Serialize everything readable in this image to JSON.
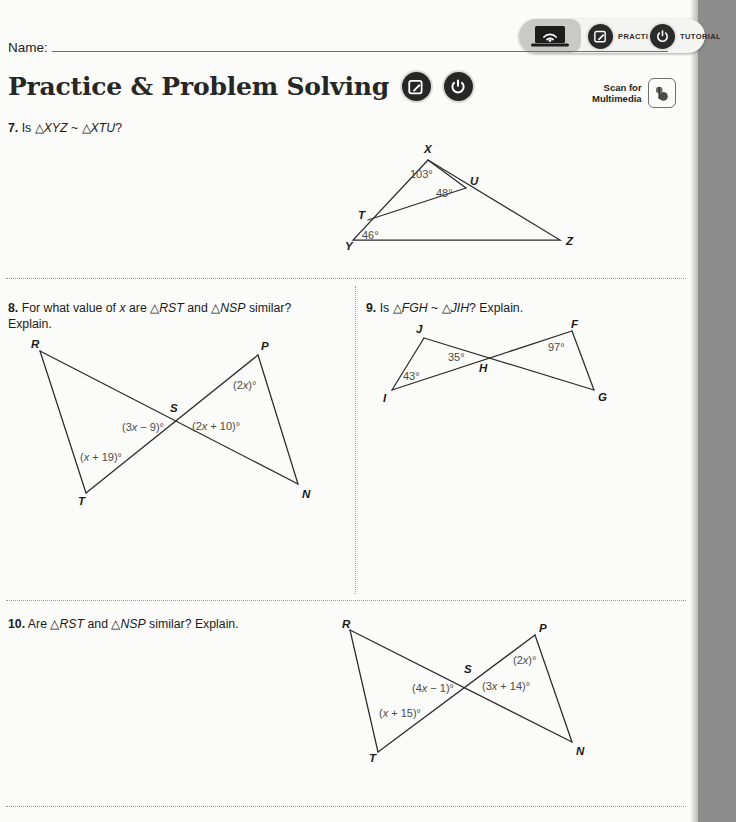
{
  "page": {
    "background_color": "#fbfbf9",
    "margin_strip_color": "#8d8d8d",
    "ink_color": "#1b1b1b",
    "angle_label_color": "#4b4b4b"
  },
  "toolbar": {
    "device_icon": "laptop-wifi-icon",
    "items": [
      {
        "icon": "pencil-square-icon",
        "label": "PRACTICE"
      },
      {
        "icon": "power-icon",
        "label": "TUTORIAL"
      }
    ]
  },
  "name_field": {
    "label": "Name:",
    "value": ""
  },
  "header": {
    "title": "Practice & Problem Solving",
    "icons": [
      {
        "icon": "pencil-square-icon",
        "name": "practice-icon"
      },
      {
        "icon": "power-icon",
        "name": "tutorial-icon"
      }
    ]
  },
  "scan": {
    "text": "Scan for\nMultimedia",
    "icon": "qr-scan-icon"
  },
  "problems": [
    {
      "number": "7.",
      "text_parts": [
        "Is ",
        "△XYZ",
        " ~ ",
        "△XTU",
        "?"
      ],
      "plain_text": "Is △XYZ ~ △XTU?",
      "figure": {
        "type": "triangle-with-inscribed-triangle",
        "vertices": [
          "X",
          "U",
          "Z",
          "Y",
          "T"
        ],
        "angles": [
          {
            "at": "X",
            "value": "103°"
          },
          {
            "at": "U",
            "value": "48°"
          },
          {
            "at": "Y",
            "value": "46°"
          }
        ]
      }
    },
    {
      "number": "8.",
      "plain_text": "For what value of x are △RST and △NSP similar? Explain.",
      "figure": {
        "type": "crossed-triangles",
        "vertices": [
          "R",
          "P",
          "S",
          "T",
          "N"
        ],
        "angles": [
          {
            "at": "P",
            "value": "(2x)°"
          },
          {
            "at": "S-left",
            "value": "(3x − 9)°"
          },
          {
            "at": "S-right",
            "value": "(2x + 10)°"
          },
          {
            "at": "T",
            "value": "(x + 19)°"
          }
        ]
      }
    },
    {
      "number": "9.",
      "plain_text": "Is △FGH ~ △JIH? Explain.",
      "figure": {
        "type": "crossed-triangles",
        "vertices": [
          "J",
          "F",
          "H",
          "I",
          "G"
        ],
        "angles": [
          {
            "at": "I",
            "value": "43°"
          },
          {
            "at": "H-left",
            "value": "35°"
          },
          {
            "at": "F",
            "value": "97°"
          }
        ]
      }
    },
    {
      "number": "10.",
      "plain_text": "Are △RST and △NSP similar? Explain.",
      "figure": {
        "type": "crossed-triangles",
        "vertices": [
          "R",
          "P",
          "S",
          "T",
          "N"
        ],
        "angles": [
          {
            "at": "P",
            "value": "(2x)°"
          },
          {
            "at": "S-left",
            "value": "(4x − 1)°"
          },
          {
            "at": "S-right",
            "value": "(3x + 14)°"
          },
          {
            "at": "T",
            "value": "(x + 15)°"
          }
        ]
      }
    }
  ]
}
